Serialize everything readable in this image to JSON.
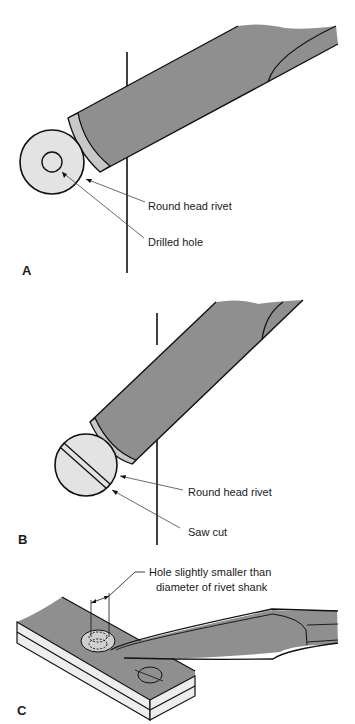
{
  "figure": {
    "panels": [
      {
        "id": "A",
        "letter": "A",
        "labels": {
          "rivet": "Round head rivet",
          "hole": "Drilled hole"
        }
      },
      {
        "id": "B",
        "letter": "B",
        "labels": {
          "rivet": "Round head rivet",
          "cut": "Saw cut"
        }
      },
      {
        "id": "C",
        "letter": "C",
        "labels": {
          "hole_line1": "Hole slightly smaller than",
          "hole_line2": "diameter of rivet shank"
        }
      }
    ],
    "colors": {
      "tool": "#8f8f8f",
      "tool_tip": "#c8c8c8",
      "rivet": "#e3e3e3",
      "plate_top": "#8f8f8f",
      "plate_side": "#ededed",
      "line": "#111111"
    }
  }
}
